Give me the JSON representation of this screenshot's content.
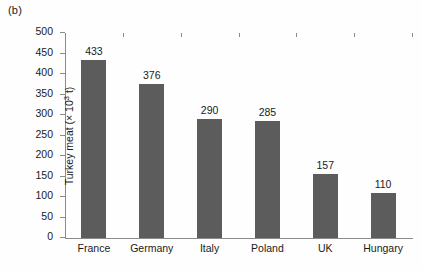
{
  "panel": {
    "label": "(b)"
  },
  "chart_data": {
    "type": "bar",
    "title": "",
    "subtitle": "",
    "xlabel": "",
    "ylabel": "Turkey meat (× 10³ t)",
    "ylabel_prefix": "Turkey meat (× 10",
    "ylabel_exponent": "3",
    "ylabel_suffix": " t)",
    "categories": [
      "France",
      "Germany",
      "Italy",
      "Poland",
      "UK",
      "Hungary"
    ],
    "values": [
      433,
      376,
      290,
      285,
      157,
      110
    ],
    "data_labels": [
      "433",
      "376",
      "290",
      "285",
      "157",
      "110"
    ],
    "ylim": [
      0,
      500
    ],
    "ytick_step": 50,
    "yticks": [
      0,
      50,
      100,
      150,
      200,
      250,
      300,
      350,
      400,
      450,
      500
    ],
    "ytick_labels": [
      "0",
      "50",
      "100",
      "150",
      "200",
      "250",
      "300",
      "350",
      "400",
      "450",
      "500"
    ],
    "grid": false,
    "legend": null,
    "bar_color": "#5c5c5c",
    "axis_color": "#8a8a8a",
    "text_color": "#1a1a1a",
    "background": "#fefefe"
  }
}
